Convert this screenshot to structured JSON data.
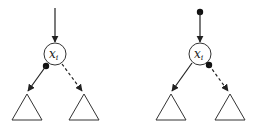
{
  "diagrams": [
    {
      "node_label": "x",
      "node_subscript": "i",
      "variant": "dot-at-left-child-edge"
    },
    {
      "node_label": "x",
      "node_subscript": "i",
      "variant": "dot-at-incoming-and-right-edge"
    }
  ],
  "colors": {
    "stroke": "#222222",
    "fill": "#ffffff"
  }
}
